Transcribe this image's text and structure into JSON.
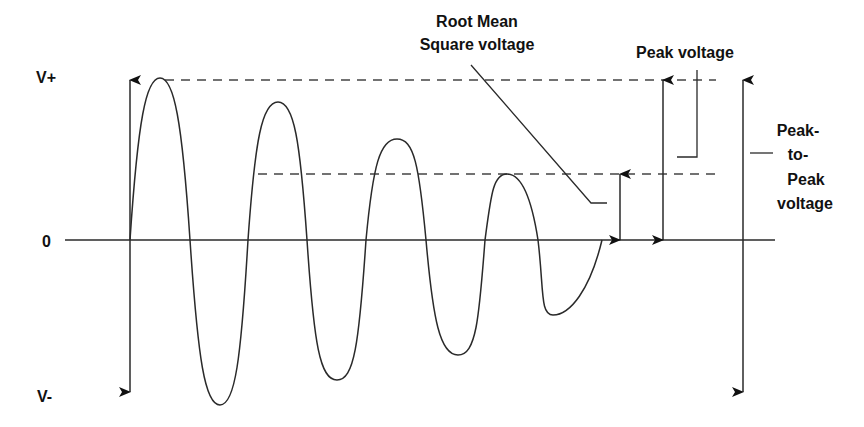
{
  "diagram": {
    "colors": {
      "line": "#2a2a2a",
      "text": "#111111",
      "dash": "#444444",
      "background": "#ffffff"
    },
    "axis_labels": {
      "top": "V+",
      "zero": "0",
      "bottom": "V-"
    },
    "annotations": {
      "rms_line1": "Root Mean",
      "rms_line2": "Square voltage",
      "peak": "Peak voltage",
      "p2p_line1": "Peak-",
      "p2p_line2": "to-",
      "p2p_line3": "Peak",
      "p2p_line4": "voltage"
    },
    "waveform": {
      "description": "Damped sine wave, decreasing amplitude",
      "peaks": [
        {
          "x": 160,
          "y": 78
        },
        {
          "x": 278,
          "y": 102
        },
        {
          "x": 397,
          "y": 139
        },
        {
          "x": 507,
          "y": 174
        }
      ],
      "troughs": [
        {
          "x": 220,
          "y": 405
        },
        {
          "x": 337,
          "y": 380
        },
        {
          "x": 458,
          "y": 355
        },
        {
          "x": 553,
          "y": 315
        }
      ]
    }
  }
}
